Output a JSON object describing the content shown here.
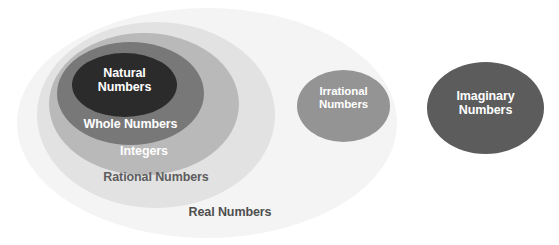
{
  "diagram": {
    "type": "venn-nested-set-diagram",
    "background_color": "#ffffff",
    "sets": [
      {
        "id": "real",
        "label": "Real Numbers",
        "fill_color": "#f4f4f4",
        "text_color": "#4f4f4f",
        "label_position": "bottom-inside",
        "contains": [
          "rational",
          "irrational"
        ]
      },
      {
        "id": "rational",
        "label": "Rational Numbers",
        "fill_color": "#e2e2e2",
        "text_color": "#5d5d5d",
        "label_position": "bottom-inside",
        "contains": [
          "integers"
        ]
      },
      {
        "id": "integers",
        "label": "Integers",
        "fill_color": "#b9b9b9",
        "text_color": "#ffffff",
        "label_position": "bottom-inside",
        "contains": [
          "whole"
        ]
      },
      {
        "id": "whole",
        "label": "Whole Numbers",
        "fill_color": "#787878",
        "text_color": "#ffffff",
        "label_position": "bottom-inside",
        "contains": [
          "natural"
        ]
      },
      {
        "id": "natural",
        "label": "Natural\nNumbers",
        "fill_color": "#2b2b2b",
        "text_color": "#ffffff",
        "label_position": "center",
        "contains": []
      },
      {
        "id": "irrational",
        "label": "Irrational\nNumbers",
        "fill_color": "#949494",
        "text_color": "#ffffff",
        "label_position": "center",
        "contains": []
      },
      {
        "id": "imaginary",
        "label": "Imaginary\nNumbers",
        "fill_color": "#5c5c5c",
        "text_color": "#ffffff",
        "label_position": "center",
        "contains": []
      }
    ]
  }
}
